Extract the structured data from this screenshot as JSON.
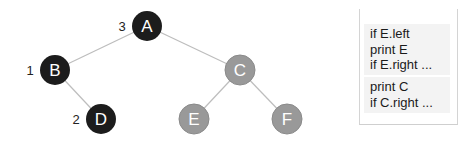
{
  "diagram": {
    "type": "binary-tree-inorder-traversal",
    "colors": {
      "visited": "#1c1c1c",
      "unvisited": "#999999",
      "edge": "#bdbdbd",
      "node_text": "#ffffff"
    },
    "nodes": [
      {
        "id": "A",
        "label": "A",
        "x": 147,
        "y": 26,
        "state": "visited",
        "order": "3"
      },
      {
        "id": "B",
        "label": "B",
        "x": 55,
        "y": 70,
        "state": "visited",
        "order": "1"
      },
      {
        "id": "C",
        "label": "C",
        "x": 240,
        "y": 70,
        "state": "unvisited",
        "order": ""
      },
      {
        "id": "D",
        "label": "D",
        "x": 101,
        "y": 119,
        "state": "visited",
        "order": "2"
      },
      {
        "id": "E",
        "label": "E",
        "x": 194,
        "y": 119,
        "state": "unvisited",
        "order": ""
      },
      {
        "id": "F",
        "label": "F",
        "x": 287,
        "y": 119,
        "state": "unvisited",
        "order": ""
      }
    ],
    "edges": [
      {
        "from": "A",
        "to": "B"
      },
      {
        "from": "A",
        "to": "C"
      },
      {
        "from": "B",
        "to": "D"
      },
      {
        "from": "C",
        "to": "E"
      },
      {
        "from": "C",
        "to": "F"
      }
    ]
  },
  "call_stack": {
    "frames": [
      {
        "lines": [
          "if E.left",
          "print E",
          "if E.right ..."
        ]
      },
      {
        "lines": [
          "print C",
          "if C.right ..."
        ]
      }
    ]
  }
}
